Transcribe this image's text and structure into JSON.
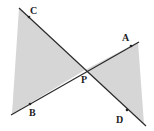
{
  "diagram": {
    "colors": {
      "line": "#2a2a2a",
      "shade": "#d4d4d4",
      "point": "#222222"
    },
    "points": {
      "P": {
        "label": "P"
      },
      "A": {
        "label": "A"
      },
      "B": {
        "label": "B"
      },
      "C": {
        "label": "C"
      },
      "D": {
        "label": "D"
      }
    },
    "segments": [
      "CD",
      "AB"
    ],
    "shaded_regions": [
      "triangle-left (C-side, B-side, P)",
      "triangle-right (A-side, D-side, P)"
    ]
  }
}
